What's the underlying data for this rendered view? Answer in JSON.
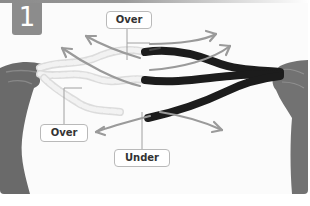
{
  "step": {
    "number": "1"
  },
  "labels": {
    "top_over": "Over",
    "bottom_over": "Over",
    "bottom_under": "Under"
  },
  "colors": {
    "badge": "#8c8c8c",
    "arrow": "#9a9a9a",
    "light_rope": "#ececec",
    "dark_rope": "#1e1e1e",
    "hand": "#6e6e6e",
    "label_border": "#b9b9b9"
  },
  "icons": {
    "arrows": [
      "arrow-up-left",
      "arrow-up-left",
      "arrow-up-right",
      "arrow-up-right",
      "arrow-down-left",
      "arrow-down-right"
    ]
  }
}
